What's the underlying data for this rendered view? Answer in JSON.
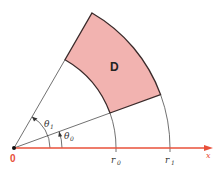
{
  "diagram": {
    "region_label": "D",
    "origin_label": "0",
    "axis_label": "x",
    "r0_label": "r",
    "r0_sub": "0",
    "r1_label": "r",
    "r1_sub": "1",
    "theta0_label": "θ",
    "theta0_sub": "0",
    "theta1_label": "θ",
    "theta1_sub": "1",
    "colors": {
      "region_fill": "#f2b3b0",
      "region_stroke": "#3a2a2a",
      "axis": "#e8503a",
      "lines": "#333333",
      "origin_label": "#e8503a"
    },
    "geometry": {
      "theta0_deg": 20,
      "theta1_deg": 60,
      "r0_px": 102,
      "r1_px": 156
    }
  }
}
